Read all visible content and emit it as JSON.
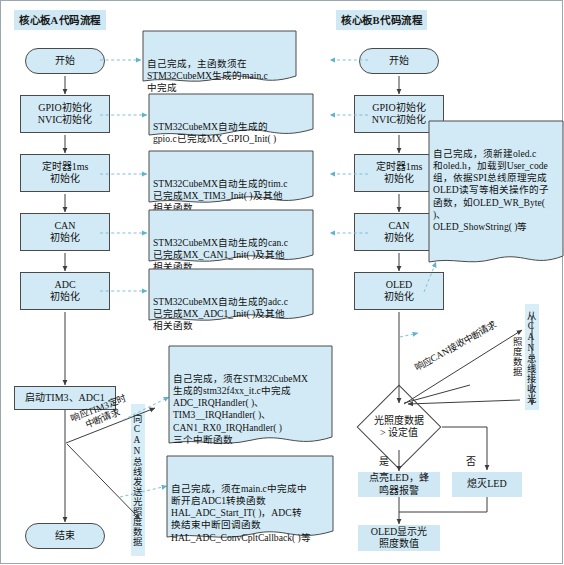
{
  "diagram": {
    "title_left": "核心板A代码流程",
    "title_right": "核心板B代码流程",
    "accent_node_fill": "#d2eaf5",
    "accent_label_fill": "#cfe8f3",
    "line_color": "#4a4a4a",
    "dashed_color": "#8fc7dd"
  },
  "left_flow": {
    "nodes": [
      {
        "id": "start",
        "label": "开始",
        "shape": "terminator"
      },
      {
        "id": "gpio",
        "label": "GPIO初始化\nNVIC初始化",
        "shape": "process"
      },
      {
        "id": "tim",
        "label": "定时器1ms\n初始化",
        "shape": "process"
      },
      {
        "id": "can",
        "label": "CAN\n初始化",
        "shape": "process"
      },
      {
        "id": "adc",
        "label": "ADC\n初始化",
        "shape": "process"
      },
      {
        "id": "starttimadc",
        "label": "启动TIM3、ADC1",
        "shape": "process"
      },
      {
        "id": "end",
        "label": "结束",
        "shape": "terminator"
      }
    ],
    "edge_labels": [
      {
        "id": "tim3-irq",
        "text": "响应TIM3定时\n中断请求"
      },
      {
        "id": "can-send",
        "text": "向CAN总线发送光照度数据"
      }
    ]
  },
  "right_flow": {
    "nodes": [
      {
        "id": "start",
        "label": "开始",
        "shape": "terminator"
      },
      {
        "id": "gpio",
        "label": "GPIO初始化\nNVIC初始化",
        "shape": "process"
      },
      {
        "id": "tim",
        "label": "定时器1ms\n初始化",
        "shape": "process"
      },
      {
        "id": "can",
        "label": "CAN\n初始化",
        "shape": "process"
      },
      {
        "id": "oled",
        "label": "OLED\n初始化",
        "shape": "process"
      },
      {
        "id": "decision",
        "label": "光照度数据\n> 设定值",
        "shape": "decision"
      },
      {
        "id": "led_on",
        "label": "点亮LED，蜂\n鸣器报警",
        "shape": "plain"
      },
      {
        "id": "led_off",
        "label": "熄灭LED",
        "shape": "plain"
      },
      {
        "id": "oled_show",
        "label": "OLED显示光\n照度数值",
        "shape": "plain"
      }
    ],
    "branch_labels": [
      {
        "id": "yes",
        "text": "是"
      },
      {
        "id": "no",
        "text": "否"
      }
    ],
    "edge_labels": [
      {
        "id": "can-recv-irq",
        "text": "响应CAN接收中断请求"
      },
      {
        "id": "can-recv",
        "text": "从CAN总线接收光照度数据"
      }
    ]
  },
  "notes": [
    {
      "id": "note-main",
      "text": "自己完成，主函数须在\nSTM32CubeMX生成的main.c\n中完成"
    },
    {
      "id": "note-gpio",
      "text": "STM32CubeMX自动生成的\ngpio.c已完成MX_GPIO_Init( )"
    },
    {
      "id": "note-tim",
      "text": "STM32CubeMX自动生成的tim.c\n已完成MX_TIM3_Init( )及其他\n相关函数"
    },
    {
      "id": "note-can",
      "text": "STM32CubeMX自动生成的can.c\n已完成MX_CAN1_Init( )及其他\n相关函数"
    },
    {
      "id": "note-adc",
      "text": "STM32CubeMX自动生成的adc.c\n已完成MX_ADC1_Init( )及其他\n相关函数"
    },
    {
      "id": "note-it",
      "text": "自己完成，须在STM32CubeMX\n生成的stm32f4xx_it.c中完成\nADC_IRQHandler( )、\nTIM3__IRQHandler( )、\nCAN1_RX0_IRQHandler( )\n三个中断函数"
    },
    {
      "id": "note-hal",
      "text": "自己完成，须在main.c中完成中\n断开启ADC1转换函数\nHAL_ADC_Start_IT( )，ADC转\n换结束中断回调函数\nHAL_ADC_ConvCpltCallback( )等"
    },
    {
      "id": "note-oled",
      "text": "自己完成，须新建oled.c\n和oled.h，加载到User_code\n组，依据SPI总线原理完成\nOLED读写等相关操作的子\n函数，如OLED_WR_Byte( )、\nOLED_ShowString( )等"
    }
  ]
}
